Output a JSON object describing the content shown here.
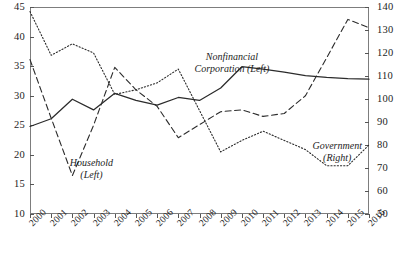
{
  "chart_data": {
    "type": "line",
    "title": "",
    "xlabel": "",
    "ylabel": "",
    "grid": false,
    "legend_position": "inline-annotations",
    "categories": [
      "2000",
      "2001",
      "2002",
      "2003",
      "2004",
      "2005",
      "2006",
      "2007",
      "2008",
      "2009",
      "2010",
      "2011",
      "2012",
      "2013",
      "2014",
      "2015",
      "2016"
    ],
    "axes": {
      "left": {
        "label": "",
        "ylim": [
          10,
          45
        ],
        "ticks": [
          10,
          15,
          20,
          25,
          30,
          35,
          40,
          45
        ],
        "series_on_axis": [
          "Nonfinancial Corporation (Left)",
          "Household (Left)"
        ]
      },
      "right": {
        "label": "",
        "ylim": [
          50,
          140
        ],
        "ticks": [
          50,
          60,
          70,
          80,
          90,
          100,
          110,
          120,
          130,
          140
        ],
        "series_on_axis": [
          "Government (Right)"
        ]
      }
    },
    "series": [
      {
        "name": "Nonfinancial Corporation (Left)",
        "axis": "left",
        "style": "solid",
        "color": "#2b2b2b",
        "values": [
          24.8,
          26.1,
          29.4,
          27.6,
          30.4,
          29.2,
          28.4,
          29.7,
          29.2,
          31.3,
          34.9,
          34.5,
          34.0,
          33.4,
          33.1,
          32.9,
          32.8
        ]
      },
      {
        "name": "Household (Left)",
        "axis": "left",
        "style": "dashed",
        "color": "#2b2b2b",
        "values": [
          36.1,
          26.2,
          16.5,
          25.0,
          34.8,
          31.0,
          28.2,
          22.9,
          25.1,
          27.3,
          27.6,
          26.5,
          27.0,
          30.0,
          36.4,
          42.9,
          41.5
        ]
      },
      {
        "name": "Government (Right)",
        "axis": "right",
        "style": "dotted",
        "color": "#2b2b2b",
        "values": [
          138,
          119,
          124,
          120,
          102,
          104,
          107,
          113,
          95,
          77,
          82,
          86,
          82,
          78,
          71,
          71,
          80
        ]
      }
    ],
    "annotations": [
      {
        "id": "nonfinancial",
        "line1": "Nonfinancial",
        "line2": "Corporation (Left)"
      },
      {
        "id": "household",
        "line1": "Household",
        "line2": "(Left)"
      },
      {
        "id": "government",
        "line1": "Government",
        "line2": "(Right)"
      }
    ]
  }
}
